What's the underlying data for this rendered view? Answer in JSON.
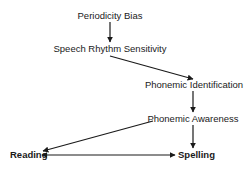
{
  "diagram": {
    "nodes": [
      {
        "id": "periodicity",
        "label": "Periodicity Bias",
        "bold": false
      },
      {
        "id": "rhythm",
        "label": "Speech Rhythm Sensitivity",
        "bold": false
      },
      {
        "id": "identification",
        "label": "Phonemic Identification",
        "bold": false
      },
      {
        "id": "awareness",
        "label": "Phonemic Awareness",
        "bold": false
      },
      {
        "id": "reading",
        "label": "Reading",
        "bold": true
      },
      {
        "id": "spelling",
        "label": "Spelling",
        "bold": true
      }
    ],
    "edges": [
      {
        "from": "periodicity",
        "to": "rhythm",
        "bidirectional": false
      },
      {
        "from": "rhythm",
        "to": "identification",
        "bidirectional": false
      },
      {
        "from": "identification",
        "to": "awareness",
        "bidirectional": false
      },
      {
        "from": "awareness",
        "to": "reading",
        "bidirectional": false
      },
      {
        "from": "awareness",
        "to": "spelling",
        "bidirectional": false
      },
      {
        "from": "reading",
        "to": "spelling",
        "bidirectional": true
      }
    ]
  }
}
